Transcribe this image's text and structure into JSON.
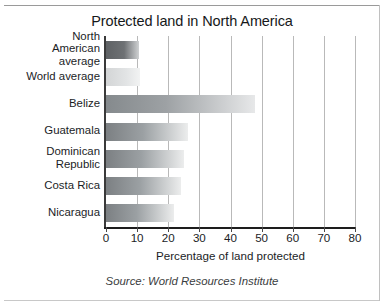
{
  "chart_data": {
    "type": "bar",
    "orientation": "horizontal",
    "title": "Protected land in North America",
    "xlabel": "Percentage of land protected",
    "ylabel": "",
    "xlim": [
      0,
      80
    ],
    "xticks": [
      "0",
      "10",
      "20",
      "30",
      "40",
      "50",
      "60",
      "70",
      "80"
    ],
    "grid": "vertical gridlines at each 10-unit tick",
    "legend": "none",
    "categories": [
      "North American average",
      "World average",
      "Belize",
      "Guatemala",
      "Dominican Republic",
      "Costa Rica",
      "Nicaragua"
    ],
    "category_lines": [
      [
        "North",
        "American",
        "average"
      ],
      [
        "World average"
      ],
      [
        "Belize"
      ],
      [
        "Guatemala"
      ],
      [
        "Dominican",
        "Republic"
      ],
      [
        "Costa Rica"
      ],
      [
        "Nicaragua"
      ]
    ],
    "values": [
      10.5,
      11,
      48,
      26.5,
      25,
      24,
      22
    ],
    "bar_styles": [
      "dark",
      "light",
      "mid",
      "mid2",
      "mid2",
      "mid2",
      "mid2"
    ],
    "annotation": "Source: World Resources Institute",
    "colors": {
      "bar_dark_start": "#5e6164",
      "bar_light_start": "#d3d5d6",
      "bar_mid_start": "#858a8d",
      "bar_end": "#f2f3f3",
      "gridline": "#b9b9b9",
      "axis": "#1d1d1d",
      "text": "#1b1d1f",
      "background": "#ffffff"
    }
  },
  "source": {
    "text": "Source: World Resources Institute"
  }
}
